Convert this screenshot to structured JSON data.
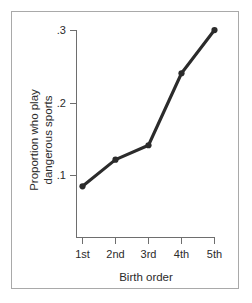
{
  "chart_data": {
    "type": "line",
    "title": "",
    "subtitle": "",
    "xlabel": "Birth order",
    "ylabel": "Proportion who play dangerous sports",
    "ylabel_lines": [
      "Proportion who play",
      "dangerous sports"
    ],
    "categories": [
      "1st",
      "2nd",
      "3rd",
      "4th",
      "5th"
    ],
    "values": [
      0.085,
      0.122,
      0.142,
      0.242,
      0.302
    ],
    "series": [
      {
        "name": "Proportion who play dangerous sports",
        "values": [
          0.085,
          0.122,
          0.142,
          0.242,
          0.302
        ]
      }
    ],
    "xtick_labels": [
      "1st",
      "2nd",
      "3rd",
      "4th",
      "5th"
    ],
    "ytick_labels": [
      ".1",
      ".2",
      ".3"
    ],
    "ytick_values": [
      0.1,
      0.2,
      0.3
    ],
    "ylim": [
      0.0,
      0.3
    ],
    "grid": false,
    "legend": false,
    "legend_position": "none",
    "markers": "filled-circle",
    "line_color": "#2b2b2b",
    "axis_color": "#6e6e6e",
    "background_color": "#ffffff",
    "border_color": "#a9a9a9"
  }
}
